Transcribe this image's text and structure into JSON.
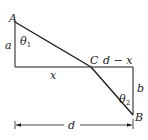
{
  "diagram": {
    "points": {
      "A": {
        "label": "A"
      },
      "B": {
        "label": "B"
      },
      "C": {
        "label": "C"
      }
    },
    "labels": {
      "a": "a",
      "b": "b",
      "x": "x",
      "d_minus_x": "d − x",
      "d": "d",
      "theta1": "θ",
      "theta1_sub": "1",
      "theta2": "θ",
      "theta2_sub": "2"
    },
    "colors": {
      "line": "#1a1a1a",
      "background": "#ffffff"
    }
  }
}
